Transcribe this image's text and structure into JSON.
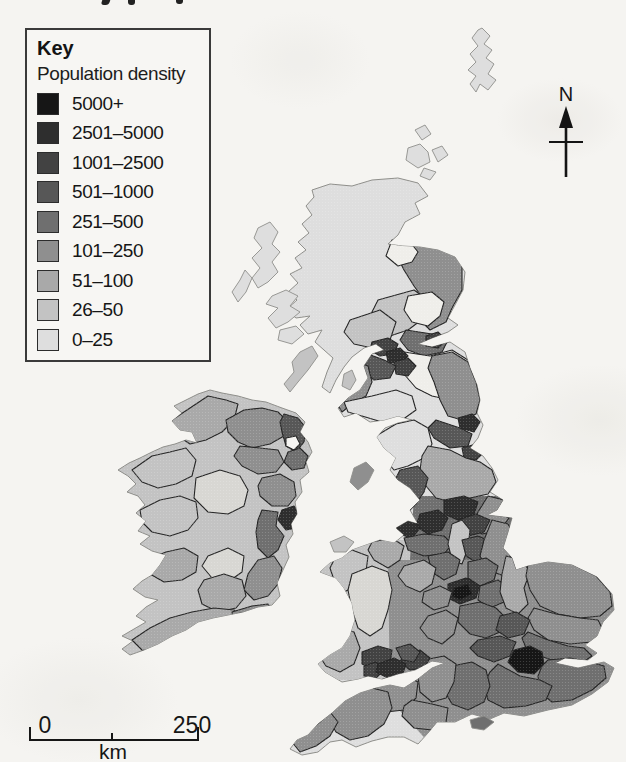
{
  "page": {
    "bg": "#f5f4f1"
  },
  "key": {
    "title": "Key",
    "subtitle": "Population density",
    "classes": [
      {
        "label": "5000+",
        "color": "#161616"
      },
      {
        "label": "2501–5000",
        "color": "#2e2e2e"
      },
      {
        "label": "1001–2500",
        "color": "#424242"
      },
      {
        "label": "501–1000",
        "color": "#575757"
      },
      {
        "label": "251–500",
        "color": "#6f6f6f"
      },
      {
        "label": "101–250",
        "color": "#8f8f8f"
      },
      {
        "label": "51–100",
        "color": "#a9a9a9"
      },
      {
        "label": "26–50",
        "color": "#c3c3c3"
      },
      {
        "label": "0–25",
        "color": "#dedede"
      }
    ]
  },
  "compass": {
    "label": "N"
  },
  "scale_bar": {
    "start_label": "0",
    "end_label": "250",
    "unit_label": "km"
  },
  "map": {
    "outline_color": "#8f8f8b",
    "border_color": "#262626",
    "white_region_color": "#efeeea",
    "light_region_color": "#d8d7d3",
    "landmasses": [
      {
        "id": "gb",
        "name": "great-britain",
        "fill": "c8",
        "points": "312,190 330,184 352,186 372,180 398,178 418,183 428,196 415,203 420,214 405,222 398,235 388,244 402,246 420,247 438,250 455,257 465,272 463,290 455,305 448,318 458,325 448,332 432,338 418,344 432,347 450,342 465,352 470,368 477,385 480,400 477,413 483,425 478,438 470,448 483,456 492,468 498,480 490,492 503,500 497,510 487,515 512,518 508,532 503,548 512,558 516,570 528,566 548,562 572,565 597,577 612,594 614,610 603,622 597,636 585,645 597,653 588,660 565,658 555,663 578,668 604,662 614,668 608,682 592,694 572,705 548,710 524,716 504,713 490,719 472,714 455,722 437,722 428,733 418,744 404,737 388,737 372,741 356,747 342,740 330,742 318,752 302,755 290,749 297,740 308,735 318,724 332,713 345,701 360,693 376,688 390,685 404,688 418,679 432,668 445,663 432,661 415,670 398,674 382,679 368,676 358,679 342,682 325,672 318,664 330,655 342,648 350,636 355,620 352,603 344,588 336,578 320,572 330,563 342,558 352,550 366,545 380,540 394,543 404,535 396,528 408,521 418,524 410,510 420,500 410,488 398,480 390,470 396,458 384,448 377,437 385,428 398,423 412,420 398,416 384,420 370,422 356,413 344,417 338,408 348,398 360,390 368,378 364,366 372,354 384,350 376,344 364,348 352,357 344,367 336,380 330,393 322,387 327,372 333,358 324,350 315,342 322,330 308,334 300,325 310,316 296,318 286,310 297,300 288,292 298,283 290,274 302,268 295,258 306,250 298,242 309,233 302,224 312,215 306,206 314,197"
      },
      {
        "id": "ie",
        "name": "ireland",
        "fill": "c7",
        "points": "222,393 238,396 252,400 266,402 282,408 296,413 305,422 300,432 308,442 312,452 306,462 309,472 300,480 302,492 295,502 297,514 291,524 293,534 286,545 289,557 283,570 277,583 280,596 272,605 258,607 243,612 228,615 213,618 198,622 186,630 172,636 158,644 144,650 130,655 122,649 133,641 122,636 134,629 146,622 136,616 146,607 158,600 145,597 133,589 142,581 152,575 160,565 166,555 152,551 140,544 150,536 138,531 146,521 136,513 145,505 138,496 127,492 136,484 128,476 118,470 129,463 140,458 152,452 163,447 175,444 186,440 197,443 192,432 180,430 172,421 182,413 174,406 186,400 198,394 210,390"
      }
    ],
    "islands": [
      {
        "name": "shetland",
        "fill": "c8",
        "points": "482,28 490,36 484,44 492,50 486,58 494,64 488,74 496,80 488,90 480,84 476,92 470,84 476,76 468,70 476,62 470,54 478,46 472,38 478,30"
      },
      {
        "name": "orkney-1",
        "fill": "c8",
        "points": "415,130 425,125 431,134 422,140"
      },
      {
        "name": "orkney-2",
        "fill": "c8",
        "points": "408,148 420,144 428,152 430,162 418,168 406,160"
      },
      {
        "name": "orkney-3",
        "fill": "c8",
        "points": "432,150 442,146 448,155 438,162"
      },
      {
        "name": "orkney-4",
        "fill": "c8",
        "points": "424,168 436,172 430,180 420,176"
      },
      {
        "name": "lewis-harris",
        "fill": "c8",
        "points": "258,228 270,222 278,232 272,244 280,252 272,262 278,272 268,282 258,288 252,278 260,268 252,258 262,248 254,238"
      },
      {
        "name": "uist",
        "fill": "c8",
        "points": "245,270 252,278 246,292 238,302 232,292 240,280"
      },
      {
        "name": "skye",
        "fill": "c8",
        "points": "272,296 286,290 298,296 290,306 300,312 288,322 276,328 268,318 278,308 266,304"
      },
      {
        "name": "mull",
        "fill": "c8",
        "points": "280,330 296,326 304,334 292,344 278,340"
      },
      {
        "name": "islay-jura",
        "fill": "c7",
        "points": "300,352 312,346 318,356 308,370 298,382 290,392 284,384 294,372 292,362"
      },
      {
        "name": "arran",
        "fill": "c7",
        "points": "344,374 352,370 356,380 350,390 342,386"
      },
      {
        "name": "isle-of-man",
        "fill": "c5",
        "points": "354,468 366,462 374,470 368,482 358,490 350,482"
      },
      {
        "name": "anglesey",
        "fill": "c7",
        "points": "330,542 344,536 354,542 346,552 334,552"
      },
      {
        "name": "isle-of-wight",
        "fill": "c4",
        "points": "470,720 484,716 494,722 484,730 472,728"
      }
    ],
    "regions": [
      {
        "land": "gb",
        "name": "wales-wash",
        "fill": "c7",
        "stroke": "none",
        "points": "318,540 412,540 412,680 316,680"
      },
      {
        "land": "gb",
        "name": "midlands-wash",
        "fill": "c4",
        "stroke": "none",
        "points": "414,496 508,496 526,560 506,622 440,626 410,560"
      },
      {
        "land": "gb",
        "name": "south-england-wash",
        "fill": "c5",
        "stroke": "none",
        "points": "388,560 620,560 620,720 560,716 500,726 432,746 390,700"
      },
      {
        "land": "gb",
        "name": "grampian",
        "fill": "c5",
        "points": "398,238 448,248 462,262 462,290 452,308 446,322 430,330 418,318 424,300 414,286 404,270 396,254"
      },
      {
        "land": "gb",
        "name": "moray",
        "fill": "white",
        "points": "392,240 410,242 418,252 412,262 398,266 386,256"
      },
      {
        "land": "gb",
        "name": "tayside",
        "fill": "c7",
        "points": "378,300 414,290 428,300 424,318 408,330 390,336 374,328 372,312"
      },
      {
        "land": "gb",
        "name": "fife",
        "fill": "white",
        "points": "408,296 432,292 444,302 440,316 428,326 412,322 404,310"
      },
      {
        "land": "gb",
        "name": "stirling",
        "fill": "c7",
        "points": "350,320 380,310 396,322 390,340 372,348 354,344 344,332"
      },
      {
        "land": "gb",
        "name": "lothian",
        "fill": "c4",
        "points": "406,330 432,334 448,340 442,352 424,356 408,350 400,340"
      },
      {
        "land": "gb",
        "name": "edinburgh",
        "fill": "c2",
        "points": "426,336 438,332 446,340 438,348 426,346"
      },
      {
        "land": "gb",
        "name": "borders",
        "fill": "white",
        "points": "404,352 430,356 452,350 468,360 474,378 468,394 450,400 432,396 416,388 404,374 398,362"
      },
      {
        "land": "gb",
        "name": "dunbartonshire",
        "fill": "c2",
        "points": "372,342 388,338 398,344 394,354 380,356 370,350"
      },
      {
        "land": "gb",
        "name": "glasgow",
        "fill": "c1",
        "points": "386,352 400,348 408,356 400,364 388,362"
      },
      {
        "land": "gb",
        "name": "lanarkshire",
        "fill": "c2",
        "points": "394,362 408,358 416,366 408,376 396,374"
      },
      {
        "land": "gb",
        "name": "south-lanark",
        "fill": "c3",
        "points": "368,354 384,360 396,366 390,378 374,380 362,370 360,360"
      },
      {
        "land": "gb",
        "name": "ayrshire",
        "fill": "c5",
        "points": "352,360 368,366 372,382 366,396 352,404 342,412 336,402 344,388 348,372"
      },
      {
        "land": "gb",
        "name": "dumfries-galloway",
        "fill": "c8",
        "points": "344,402 372,396 396,390 412,396 416,410 402,420 382,422 362,416 348,412"
      },
      {
        "land": "gb",
        "name": "northumberland",
        "fill": "c5",
        "points": "432,356 452,352 468,362 476,382 480,400 476,414 462,420 448,416 440,400 434,382 428,368"
      },
      {
        "land": "gb",
        "name": "tyne-wear",
        "fill": "c1",
        "points": "458,418 472,414 480,422 474,432 460,428"
      },
      {
        "land": "gb",
        "name": "durham",
        "fill": "c3",
        "points": "436,420 460,428 472,434 468,446 450,448 434,438 428,428"
      },
      {
        "land": "gb",
        "name": "cleveland",
        "fill": "c2",
        "points": "462,448 476,444 484,452 476,460 464,458"
      },
      {
        "land": "gb",
        "name": "cumbria",
        "fill": "c8",
        "points": "376,436 396,424 414,420 428,428 432,444 424,458 408,466 394,470 384,458 378,446"
      },
      {
        "land": "gb",
        "name": "north-yorkshire",
        "fill": "c6",
        "points": "428,446 450,450 466,458 480,462 492,470 496,482 488,494 470,498 452,502 436,498 426,486 420,470 422,456"
      },
      {
        "land": "gb",
        "name": "lancashire",
        "fill": "c3",
        "points": "400,470 418,466 428,478 424,492 416,504 406,514 398,504 402,488 396,478"
      },
      {
        "land": "gb",
        "name": "humberside",
        "fill": "c5",
        "points": "488,496 504,500 497,512 509,518 500,530 482,534 472,526 478,512"
      },
      {
        "land": "gb",
        "name": "west-yorkshire",
        "fill": "c1",
        "points": "444,500 464,496 478,502 474,514 458,520 444,514"
      },
      {
        "land": "gb",
        "name": "south-yorkshire",
        "fill": "c2",
        "points": "458,520 476,514 490,520 484,532 468,536 456,530"
      },
      {
        "land": "gb",
        "name": "greater-manchester",
        "fill": "c1",
        "points": "420,514 438,510 448,518 442,530 428,534 416,526"
      },
      {
        "land": "gb",
        "name": "merseyside",
        "fill": "c1",
        "points": "396,522 412,518 420,528 412,538 398,534"
      },
      {
        "land": "gb",
        "name": "cheshire",
        "fill": "c4",
        "points": "404,538 424,534 444,536 452,544 444,554 424,556 408,550"
      },
      {
        "land": "gb",
        "name": "peak-district",
        "fill": "c7",
        "points": "452,524 462,520 470,530 468,548 462,564 452,560 448,544"
      },
      {
        "land": "gb",
        "name": "nottinghamshire",
        "fill": "c3",
        "points": "462,540 478,536 492,542 488,556 476,562 466,556"
      },
      {
        "land": "gb",
        "name": "lincolnshire",
        "fill": "c5",
        "points": "492,520 508,524 516,540 510,556 516,568 504,576 488,570 480,556 484,540"
      },
      {
        "land": "gb",
        "name": "staffordshire",
        "fill": "c4",
        "points": "428,556 448,552 460,560 456,574 444,580 432,572"
      },
      {
        "land": "gb",
        "name": "shropshire",
        "fill": "c6",
        "points": "404,566 424,560 436,568 432,584 420,592 406,586 398,576"
      },
      {
        "land": "gb",
        "name": "west-midlands",
        "fill": "c1",
        "points": "448,584 466,578 480,584 476,598 460,604 448,598"
      },
      {
        "land": "gb",
        "name": "birmingham-core",
        "fill": "c0",
        "points": "454,588 468,584 472,594 460,600 452,596"
      },
      {
        "land": "gb",
        "name": "leicestershire",
        "fill": "c4",
        "points": "468,562 486,558 498,566 494,580 480,586 468,578"
      },
      {
        "land": "gb",
        "name": "northamptonshire",
        "fill": "c4",
        "points": "480,586 498,580 510,588 504,602 490,608 478,600"
      },
      {
        "land": "gb",
        "name": "cambridgeshire",
        "fill": "c6",
        "points": "506,556 522,560 530,572 524,588 528,604 518,614 506,608 500,592 502,574"
      },
      {
        "land": "gb",
        "name": "norfolk",
        "fill": "c5",
        "points": "528,564 548,560 572,564 596,576 610,592 612,606 600,616 580,618 558,614 540,606 530,590 526,576"
      },
      {
        "land": "gb",
        "name": "suffolk",
        "fill": "c5",
        "points": "534,608 556,614 580,618 598,620 604,632 592,642 570,644 548,640 534,630 528,618"
      },
      {
        "land": "gb",
        "name": "essex",
        "fill": "c4",
        "points": "528,632 548,640 568,646 584,648 592,656 580,664 558,662 540,656 526,648 522,638"
      },
      {
        "land": "gb",
        "name": "worcestershire",
        "fill": "c5",
        "points": "424,592 440,586 452,592 448,606 434,610 422,602"
      },
      {
        "land": "gb",
        "name": "gloucestershire",
        "fill": "c5",
        "points": "428,616 446,610 458,618 454,634 442,644 428,638 420,628"
      },
      {
        "land": "gb",
        "name": "oxfordshire",
        "fill": "c4",
        "points": "460,606 480,602 496,608 506,618 500,632 486,638 470,634 458,622"
      },
      {
        "land": "gb",
        "name": "hertfordshire",
        "fill": "c3",
        "points": "500,616 516,612 530,620 524,634 508,638 496,630"
      },
      {
        "land": "gb",
        "name": "home-counties",
        "fill": "c3",
        "points": "478,640 500,636 516,642 510,656 494,662 478,656 470,648"
      },
      {
        "land": "gb",
        "name": "london",
        "fill": "c0",
        "points": "514,650 530,646 542,652 544,664 534,674 518,672 508,662"
      },
      {
        "land": "gb",
        "name": "kent",
        "fill": "c4",
        "points": "548,660 570,658 590,662 604,666 606,678 592,690 572,700 552,702 540,692 538,676 542,666"
      },
      {
        "land": "gb",
        "name": "sussex",
        "fill": "c4",
        "points": "498,664 520,676 540,680 552,686 546,700 526,706 504,708 488,700 484,684 490,672"
      },
      {
        "land": "gb",
        "name": "hampshire",
        "fill": "c4",
        "points": "452,666 472,662 486,670 490,686 484,702 468,710 452,704 444,690 446,676"
      },
      {
        "land": "gb",
        "name": "wiltshire",
        "fill": "c5",
        "points": "424,660 444,656 456,664 454,682 446,698 432,702 420,692 418,676"
      },
      {
        "land": "gb",
        "name": "avon-bristol",
        "fill": "c2",
        "points": "404,654 420,650 430,658 424,668 410,670 400,662"
      },
      {
        "land": "gb",
        "name": "somerset",
        "fill": "c5",
        "points": "380,680 402,674 418,682 416,698 404,710 386,712 372,702 372,690"
      },
      {
        "land": "gb",
        "name": "dorset",
        "fill": "c5",
        "points": "412,700 432,704 448,708 446,722 432,730 414,728 402,716 404,706"
      },
      {
        "land": "gb",
        "name": "devon",
        "fill": "c5",
        "points": "330,700 352,692 372,688 388,692 392,708 384,724 368,736 350,740 336,732 326,716"
      },
      {
        "land": "gb",
        "name": "cornwall",
        "fill": "c5",
        "points": "292,742 306,732 320,722 330,712 338,722 330,736 316,746 300,752"
      },
      {
        "land": "gb",
        "name": "clwyd",
        "fill": "c6",
        "points": "372,542 392,538 404,546 400,560 388,568 374,560 368,550"
      },
      {
        "land": "gb",
        "name": "gwynedd",
        "fill": "c7",
        "points": "334,560 352,550 368,556 366,572 356,586 344,592 334,580 330,568"
      },
      {
        "land": "gb",
        "name": "powys",
        "fill": "light",
        "points": "352,574 372,566 388,572 392,590 388,610 382,628 370,636 358,628 352,610 348,590"
      },
      {
        "land": "gb",
        "name": "dyfed",
        "fill": "c6",
        "points": "322,640 340,628 354,632 360,648 354,664 340,672 326,666 318,654"
      },
      {
        "land": "gb",
        "name": "valleys",
        "fill": "c2",
        "points": "362,652 378,646 392,650 390,664 376,670 362,664"
      },
      {
        "land": "gb",
        "name": "swansea",
        "fill": "c2",
        "points": "364,666 376,662 384,670 376,678 364,676"
      },
      {
        "land": "gb",
        "name": "glamorgan-cardiff",
        "fill": "c1",
        "points": "378,664 394,658 406,664 402,676 388,678 376,672"
      },
      {
        "land": "gb",
        "name": "gwent",
        "fill": "c3",
        "points": "396,648 410,644 420,652 414,662 402,660"
      },
      {
        "land": "ie",
        "name": "donegal",
        "fill": "c6",
        "points": "172,420 190,408 208,396 226,400 238,404 234,420 222,432 206,440 190,444 178,436 170,428"
      },
      {
        "land": "ie",
        "name": "tyrone-derry",
        "fill": "c5",
        "points": "226,420 244,410 262,408 278,412 288,422 284,436 270,444 252,448 238,442 228,432"
      },
      {
        "land": "ie",
        "name": "antrim-belfast",
        "fill": "c3",
        "points": "284,414 298,418 306,428 304,442 296,452 286,446 282,432 280,422"
      },
      {
        "land": "ie",
        "name": "down",
        "fill": "c4",
        "points": "288,452 300,448 308,456 304,468 292,470 284,462"
      },
      {
        "land": "ie",
        "name": "lough-neagh",
        "fill": "paper",
        "points": "286,438 296,436 300,444 294,450 286,446"
      },
      {
        "land": "ie",
        "name": "armagh-fermanagh",
        "fill": "c5",
        "points": "240,446 260,448 278,450 284,462 276,472 258,474 242,466 234,456"
      },
      {
        "land": "ie",
        "name": "louth-meath",
        "fill": "c5",
        "points": "262,478 280,474 294,482 296,496 288,506 272,506 260,496 258,486"
      },
      {
        "land": "ie",
        "name": "dublin",
        "fill": "c1",
        "points": "282,510 294,506 300,516 296,528 286,530 278,520"
      },
      {
        "land": "ie",
        "name": "kildare-wicklow",
        "fill": "c4",
        "points": "262,510 278,512 276,526 284,536 278,550 268,558 258,548 256,532 258,520"
      },
      {
        "land": "ie",
        "name": "wexford",
        "fill": "c5",
        "points": "258,560 274,556 282,568 278,584 268,596 254,600 244,590 248,574"
      },
      {
        "land": "ie",
        "name": "midlands",
        "fill": "light",
        "points": "196,478 220,470 240,476 248,490 244,506 228,514 208,512 194,498"
      },
      {
        "land": "ie",
        "name": "south-midlands",
        "fill": "light",
        "points": "208,556 228,548 244,556 242,572 228,582 212,578 202,566"
      },
      {
        "land": "ie",
        "name": "mayo",
        "fill": "c7",
        "points": "132,470 152,456 170,452 186,448 196,460 192,476 176,484 158,488 142,482"
      },
      {
        "land": "ie",
        "name": "galway",
        "fill": "c7",
        "points": "140,510 160,500 180,496 196,502 198,518 188,530 170,536 152,532 142,522"
      },
      {
        "land": "ie",
        "name": "clare-limerick",
        "fill": "c6",
        "points": "146,560 166,552 184,548 198,556 196,572 182,580 164,582 150,574"
      },
      {
        "land": "ie",
        "name": "tipperary",
        "fill": "c6",
        "points": "204,580 224,574 242,580 246,596 236,608 218,612 202,604 198,590"
      },
      {
        "land": "ie",
        "name": "cork-kerry",
        "fill": "c6",
        "points": "132,640 150,628 170,618 192,612 214,608 234,610 248,616 244,630 226,638 204,644 182,650 160,652 142,650"
      },
      {
        "land": "ie",
        "name": "waterford",
        "fill": "c5",
        "points": "232,612 252,606 268,604 274,614 264,624 246,628 234,622"
      }
    ]
  }
}
